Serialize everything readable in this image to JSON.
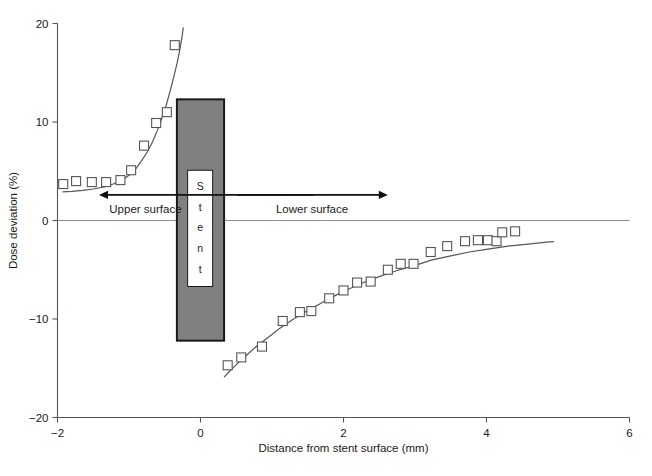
{
  "chart_data": {
    "type": "scatter",
    "title": "",
    "xlabel": "Distance from stent surface (mm)",
    "ylabel": "Dose deviation (%)",
    "xlim": [
      -2,
      6
    ],
    "ylim": [
      -20,
      20
    ],
    "xticks": [
      -2,
      0,
      2,
      4,
      6
    ],
    "xticklabels": [
      "−2",
      "0",
      "2",
      "4",
      "6"
    ],
    "yticks": [
      -20,
      -10,
      0,
      10,
      20
    ],
    "yticklabels": [
      "−20",
      "−10",
      "0",
      "10",
      "20"
    ],
    "grid": false,
    "legend": null,
    "marker": "open-square",
    "series": [
      {
        "name": "Upper surface measurements",
        "marker": "open-square",
        "points": [
          [
            -1.92,
            3.7
          ],
          [
            -1.74,
            4.0
          ],
          [
            -1.52,
            3.9
          ],
          [
            -1.32,
            3.9
          ],
          [
            -1.12,
            4.1
          ],
          [
            -0.97,
            5.1
          ],
          [
            -0.79,
            7.6
          ],
          [
            -0.62,
            9.9
          ],
          [
            -0.47,
            11.0
          ],
          [
            -0.36,
            17.8
          ]
        ]
      },
      {
        "name": "Lower surface measurements",
        "marker": "open-square",
        "points": [
          [
            0.38,
            -14.7
          ],
          [
            0.57,
            -13.9
          ],
          [
            0.86,
            -12.8
          ],
          [
            1.15,
            -10.2
          ],
          [
            1.39,
            -9.3
          ],
          [
            1.55,
            -9.2
          ],
          [
            1.8,
            -7.9
          ],
          [
            2.0,
            -7.1
          ],
          [
            2.19,
            -6.3
          ],
          [
            2.38,
            -6.2
          ],
          [
            2.62,
            -5.0
          ],
          [
            2.8,
            -4.4
          ],
          [
            2.98,
            -4.4
          ],
          [
            3.22,
            -3.2
          ],
          [
            3.45,
            -2.6
          ],
          [
            3.7,
            -2.1
          ],
          [
            3.88,
            -2.0
          ],
          [
            4.02,
            -2.0
          ],
          [
            4.14,
            -2.1
          ],
          [
            4.22,
            -1.2
          ],
          [
            4.4,
            -1.1
          ]
        ]
      }
    ],
    "fit_curves": [
      {
        "name": "Upper surface fit",
        "points": [
          [
            -1.93,
            2.9
          ],
          [
            -1.8,
            2.95
          ],
          [
            -1.65,
            3.05
          ],
          [
            -1.5,
            3.2
          ],
          [
            -1.35,
            3.4
          ],
          [
            -1.22,
            3.7
          ],
          [
            -1.1,
            4.1
          ],
          [
            -1.0,
            4.6
          ],
          [
            -0.9,
            5.3
          ],
          [
            -0.82,
            6.1
          ],
          [
            -0.74,
            7.0
          ],
          [
            -0.67,
            8.0
          ],
          [
            -0.6,
            9.2
          ],
          [
            -0.54,
            10.4
          ],
          [
            -0.48,
            11.7
          ],
          [
            -0.43,
            13.0
          ],
          [
            -0.38,
            14.4
          ],
          [
            -0.33,
            15.9
          ],
          [
            -0.29,
            17.3
          ],
          [
            -0.26,
            18.6
          ],
          [
            -0.24,
            19.6
          ]
        ]
      },
      {
        "name": "Lower surface fit",
        "points": [
          [
            0.33,
            -15.9
          ],
          [
            0.42,
            -15.2
          ],
          [
            0.52,
            -14.5
          ],
          [
            0.64,
            -13.7
          ],
          [
            0.78,
            -12.8
          ],
          [
            0.94,
            -11.9
          ],
          [
            1.1,
            -11.0
          ],
          [
            1.28,
            -10.1
          ],
          [
            1.46,
            -9.3
          ],
          [
            1.66,
            -8.5
          ],
          [
            1.86,
            -7.7
          ],
          [
            2.06,
            -7.0
          ],
          [
            2.28,
            -6.3
          ],
          [
            2.5,
            -5.7
          ],
          [
            2.74,
            -5.1
          ],
          [
            2.98,
            -4.6
          ],
          [
            3.24,
            -4.0
          ],
          [
            3.5,
            -3.6
          ],
          [
            3.76,
            -3.2
          ],
          [
            4.02,
            -2.9
          ],
          [
            4.3,
            -2.6
          ],
          [
            4.58,
            -2.4
          ],
          [
            4.84,
            -2.2
          ],
          [
            4.94,
            -2.15
          ]
        ]
      }
    ],
    "stent": {
      "label_letters": [
        "S",
        "t",
        "e",
        "n",
        "t"
      ],
      "x_left": -0.33,
      "x_right": 0.33,
      "y_top": 12.3,
      "y_bottom": -12.2,
      "fill_color": "#808080",
      "border_color": "#1a1a1a",
      "inner_fill": "#ffffff",
      "inner_x_left": -0.18,
      "inner_x_right": 0.17,
      "inner_y_top": 5.1,
      "inner_y_bottom": -6.7
    },
    "annotations": [
      {
        "name": "upper-surface-arrow",
        "text": "Upper surface",
        "direction": "left",
        "arrow_x_start": 1.58,
        "arrow_x_end": -1.42,
        "arrow_y": 2.6,
        "text_x": -0.77,
        "text_y": 1.15
      },
      {
        "name": "lower-surface-arrow",
        "text": "Lower surface",
        "direction": "right",
        "arrow_x_start": 0.51,
        "arrow_x_end": 2.62,
        "arrow_y": 2.6,
        "text_x": 1.56,
        "text_y": 1.15
      }
    ],
    "colors": {
      "axis": "#555555",
      "marker_stroke": "#555555",
      "curve": "#555555",
      "stent_fill": "#808080",
      "text": "#1a1a1a"
    }
  }
}
